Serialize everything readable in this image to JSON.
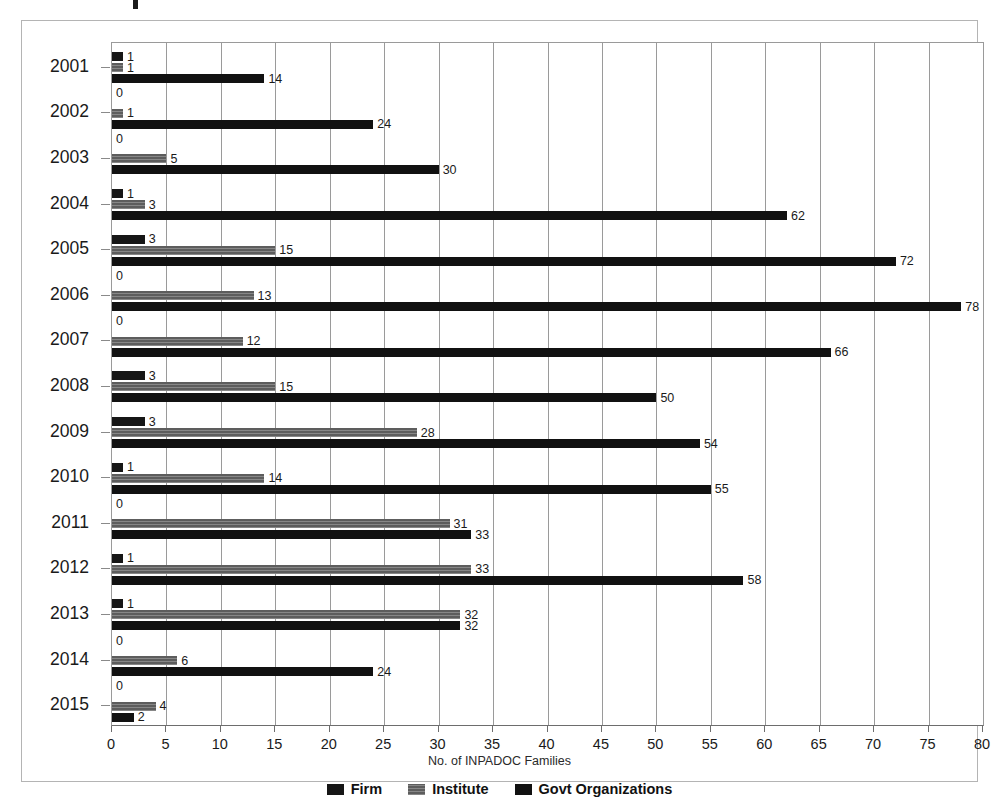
{
  "chart_data": {
    "type": "bar",
    "orientation": "horizontal",
    "title": "",
    "xlabel": "No. of INPADOC Families",
    "ylabel": "",
    "xlim": [
      0,
      80
    ],
    "xticks": [
      0,
      5,
      10,
      15,
      20,
      25,
      30,
      35,
      40,
      45,
      50,
      55,
      60,
      65,
      70,
      75,
      80
    ],
    "xtick_labels": [
      "0",
      "5",
      "10",
      "15",
      "20",
      "25",
      "30",
      "35",
      "40",
      "45",
      "50",
      "55",
      "60",
      "65",
      "70",
      "75",
      "80"
    ],
    "grid": "vertical",
    "legend_position": "bottom",
    "categories": [
      "2001",
      "2002",
      "2003",
      "2004",
      "2005",
      "2006",
      "2007",
      "2008",
      "2009",
      "2010",
      "2011",
      "2012",
      "2013",
      "2014",
      "2015"
    ],
    "series": [
      {
        "name": "Firm",
        "color": "#161616",
        "values": [
          1,
          0,
          0,
          1,
          3,
          0,
          0,
          3,
          3,
          1,
          0,
          1,
          1,
          0,
          0
        ]
      },
      {
        "name": "Institute",
        "color": "#5d5d5d",
        "values": [
          1,
          1,
          5,
          3,
          15,
          13,
          12,
          15,
          28,
          14,
          31,
          33,
          32,
          6,
          4
        ]
      },
      {
        "name": "Govt Organizations",
        "color": "#111111",
        "values": [
          14,
          24,
          30,
          62,
          72,
          78,
          66,
          50,
          54,
          55,
          33,
          58,
          32,
          24,
          2
        ]
      }
    ]
  },
  "legend": {
    "items": [
      {
        "label": "Firm",
        "color": "#161616",
        "pattern": "solid"
      },
      {
        "label": "Institute",
        "color": "#5d5d5d",
        "pattern": "hatched"
      },
      {
        "label": "Govt Organizations",
        "color": "#111111",
        "pattern": "solid"
      }
    ]
  }
}
